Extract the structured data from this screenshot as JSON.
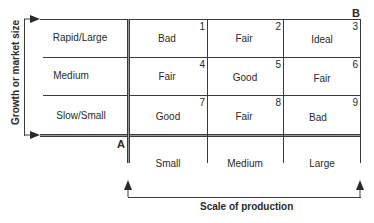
{
  "diagram": {
    "corner_labels": {
      "origin": "A",
      "ideal_corner": "B"
    },
    "y_axis": {
      "label": "Growth or market size",
      "rows": [
        "Rapid/Large",
        "Medium",
        "Slow/Small"
      ]
    },
    "x_axis": {
      "label": "Scale of production",
      "columns": [
        "Small",
        "Medium",
        "Large"
      ]
    },
    "cells": [
      {
        "number": "1",
        "rating": "Bad"
      },
      {
        "number": "2",
        "rating": "Fair"
      },
      {
        "number": "3",
        "rating": "Ideal"
      },
      {
        "number": "4",
        "rating": "Fair"
      },
      {
        "number": "5",
        "rating": "Good"
      },
      {
        "number": "6",
        "rating": "Fair"
      },
      {
        "number": "7",
        "rating": "Good"
      },
      {
        "number": "8",
        "rating": "Fair"
      },
      {
        "number": "9",
        "rating": "Bad"
      }
    ],
    "colors": {
      "line": "#3a3a3a",
      "text": "#2a2a2a",
      "axis_fill": "#9a9a9a"
    }
  }
}
